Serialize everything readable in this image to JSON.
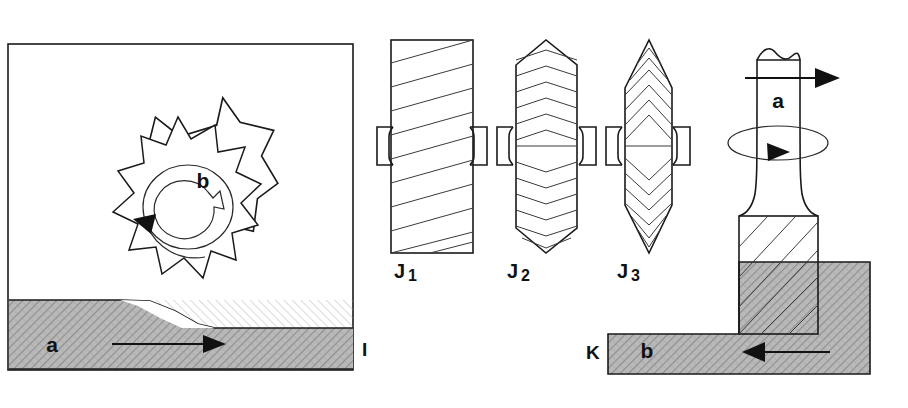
{
  "figure": {
    "background_color": "#ffffff",
    "line_color": "#1a1a1a",
    "workpiece_fill_color": "#b3b3b3",
    "width": 908,
    "height": 408
  },
  "panels": [
    {
      "id": "panel-I",
      "label": "I",
      "caption": "Slab / peripheral milling — cutter above moving workpiece",
      "annotations": [
        {
          "name": "workpiece-feed-label",
          "text": "a",
          "meaning": "workpiece feed direction"
        },
        {
          "name": "cutter-rotation-label",
          "text": "b",
          "meaning": "cutter rotation"
        }
      ]
    },
    {
      "id": "panel-J",
      "label": "J",
      "caption": "Cutter tooth form comparison",
      "cutters": [
        {
          "name": "cutter-j1",
          "label": "J",
          "sub": "1",
          "tooth_form": "straight helical teeth, cylindrical body"
        },
        {
          "name": "cutter-j2",
          "label": "J",
          "sub": "2",
          "tooth_form": "chevron / herringbone teeth, tapered ends"
        },
        {
          "name": "cutter-j3",
          "label": "J",
          "sub": "3",
          "tooth_form": "steep chevron teeth, pointed conical ends"
        }
      ]
    },
    {
      "id": "panel-K",
      "label": "K",
      "caption": "End milling — vertical end mill cutting a step",
      "annotations": [
        {
          "name": "spindle-axis-label",
          "text": "a",
          "meaning": "cutter axis / rotation"
        },
        {
          "name": "workpiece-feed-label",
          "text": "b",
          "meaning": "workpiece feed direction"
        }
      ]
    }
  ],
  "labels": {
    "panel_i": "I",
    "panel_k": "K",
    "j1_main": "J",
    "j1_sub": "1",
    "j2_main": "J",
    "j2_sub": "2",
    "j3_main": "J",
    "j3_sub": "3",
    "left_workpiece": "a",
    "left_cutter": "b",
    "right_spindle": "a",
    "right_workpiece": "b"
  },
  "arrows": [
    {
      "name": "left-feed-arrow",
      "direction": "right",
      "meaning": "workpiece a feeds right"
    },
    {
      "name": "left-rotation-arrow",
      "direction": "counterclockwise",
      "meaning": "cutter b rotates"
    },
    {
      "name": "right-axis-arrow",
      "direction": "right",
      "meaning": "axial direction"
    },
    {
      "name": "right-rotation-arrow",
      "direction": "clockwise",
      "meaning": "spindle rotation"
    },
    {
      "name": "right-feed-arrow",
      "direction": "left",
      "meaning": "workpiece b feeds left"
    }
  ]
}
